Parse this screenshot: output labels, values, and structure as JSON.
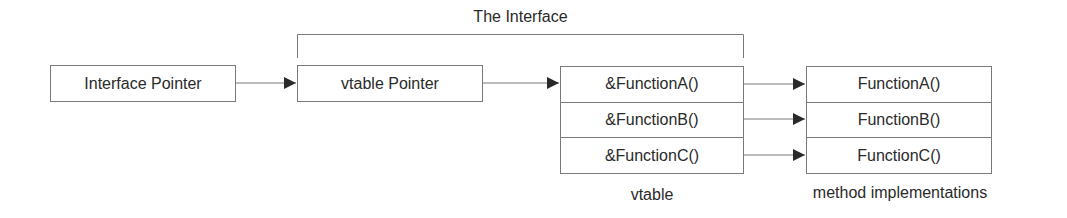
{
  "title": "The Interface",
  "nodes": {
    "interface_pointer": "Interface Pointer",
    "vtable_pointer": "vtable Pointer"
  },
  "vtable": {
    "caption": "vtable",
    "entries": [
      "&FunctionA()",
      "&FunctionB()",
      "&FunctionC()"
    ]
  },
  "methods": {
    "caption": "method implementations",
    "entries": [
      "FunctionA()",
      "FunctionB()",
      "FunctionC()"
    ]
  },
  "colors": {
    "line": "#7a7a7a",
    "arrowhead": "#2a2a2a",
    "text": "#2a2a2a"
  }
}
